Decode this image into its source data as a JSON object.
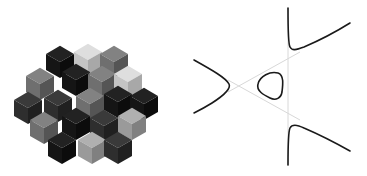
{
  "figure": {
    "panels": [
      {
        "id": "cube-assembly",
        "description": "Hexagonal cluster of stacked isometric cubes rendered in grayscale",
        "colors": {
          "black": "#151515",
          "dark": "#2e2e2e",
          "mid_dark": "#4a4a4a",
          "mid": "#6f6f6f",
          "light": "#9a9a9a",
          "lighter": "#c4c4c4",
          "lightest": "#dedede"
        }
      },
      {
        "id": "cubic-curve-plot",
        "description": "Plane cubic curve with an oval component and three unbounded branches, shown with three gray asymptote lines forming a triangle",
        "curve_color": "#1a1a1a",
        "asymptote_color": "#d6d6d6"
      }
    ]
  }
}
